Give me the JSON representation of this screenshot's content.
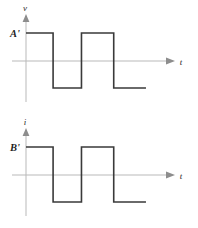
{
  "figure": {
    "caption": "",
    "background_color": "#ffffff",
    "wave_color": "#3a3a3a",
    "axis_color": "#b9b9b9",
    "label_color": "#1f1f1f"
  },
  "panels": [
    {
      "id": "voltage",
      "y_axis_label": "v",
      "x_axis_label": "t",
      "level_label": "A'",
      "chart_data": {
        "type": "line",
        "title": "",
        "xlabel": "t",
        "ylabel": "v",
        "grid": false,
        "legend": "none",
        "xlim": [
          0,
          1
        ],
        "ylim": [
          -1,
          1
        ],
        "x": [
          0.0,
          0.21,
          0.21,
          0.43,
          0.43,
          0.68,
          0.68,
          0.93
        ],
        "values": [
          1,
          1,
          -1,
          -1,
          1,
          1,
          -1,
          -1
        ],
        "annotations": [
          "A'"
        ]
      }
    },
    {
      "id": "current",
      "y_axis_label": "i",
      "x_axis_label": "t",
      "level_label": "B'",
      "chart_data": {
        "type": "line",
        "title": "",
        "xlabel": "t",
        "ylabel": "i",
        "grid": false,
        "legend": "none",
        "xlim": [
          0,
          1
        ],
        "ylim": [
          -1,
          1
        ],
        "x": [
          0.0,
          0.21,
          0.21,
          0.43,
          0.43,
          0.68,
          0.68,
          0.93
        ],
        "values": [
          1,
          1,
          -1,
          -1,
          1,
          1,
          -1,
          -1
        ],
        "annotations": [
          "B'"
        ]
      }
    }
  ]
}
